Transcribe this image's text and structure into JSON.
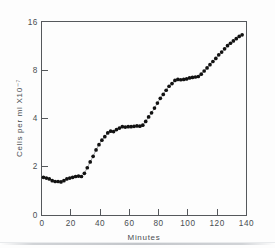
{
  "figure": {
    "background_color": "#fdfdfd",
    "axis_color": "#55585c",
    "marker_color": "#121212",
    "line_color": "#7b7e82"
  },
  "chart_data": {
    "type": "scatter",
    "title": "",
    "subtitle": "",
    "xlabel": "Minutes",
    "ylabel": "Cells per ml X10⁻⁷",
    "grid": false,
    "legend": null,
    "yscale": "log",
    "xscale": "linear",
    "xlim": [
      0,
      140
    ],
    "ylim": [
      1,
      16
    ],
    "xticks": [
      0,
      20,
      40,
      60,
      80,
      100,
      120,
      140
    ],
    "xticklabels": [
      "0",
      "20",
      "40",
      "60",
      "80",
      "100",
      "120",
      "140"
    ],
    "yticks": [
      2,
      4,
      8,
      16
    ],
    "yticklabels": [
      "2",
      "4",
      "8",
      "16"
    ],
    "y_origin_label": "0",
    "series": [
      {
        "name": "Cell density",
        "marker": "filled-circle",
        "connected": true,
        "x": [
          1,
          3,
          5,
          7,
          9,
          11,
          13,
          15,
          17,
          19,
          21,
          23,
          25,
          27,
          29,
          31,
          33,
          35,
          37,
          39,
          41,
          43,
          45,
          47,
          49,
          51,
          53,
          55,
          57,
          59,
          61,
          63,
          65,
          67,
          69,
          71,
          73,
          75,
          77,
          79,
          81,
          83,
          85,
          87,
          89,
          91,
          93,
          95,
          97,
          99,
          101,
          103,
          105,
          107,
          109,
          111,
          113,
          115,
          117,
          119,
          121,
          123,
          125,
          127,
          129,
          131,
          133,
          135,
          137
        ],
        "y": [
          1.7,
          1.68,
          1.66,
          1.62,
          1.6,
          1.6,
          1.59,
          1.62,
          1.66,
          1.68,
          1.7,
          1.72,
          1.73,
          1.72,
          1.8,
          1.95,
          2.12,
          2.3,
          2.52,
          2.72,
          2.9,
          3.05,
          3.22,
          3.3,
          3.28,
          3.38,
          3.45,
          3.52,
          3.5,
          3.52,
          3.52,
          3.54,
          3.56,
          3.55,
          3.6,
          3.8,
          4.05,
          4.3,
          4.6,
          4.95,
          5.3,
          5.6,
          5.95,
          6.3,
          6.55,
          6.85,
          6.95,
          6.92,
          6.95,
          7.0,
          7.1,
          7.15,
          7.2,
          7.25,
          7.5,
          7.85,
          8.2,
          8.6,
          9.0,
          9.4,
          9.9,
          10.3,
          10.8,
          11.3,
          11.7,
          12.1,
          12.5,
          12.9,
          13.2
        ]
      }
    ],
    "annotations": []
  }
}
